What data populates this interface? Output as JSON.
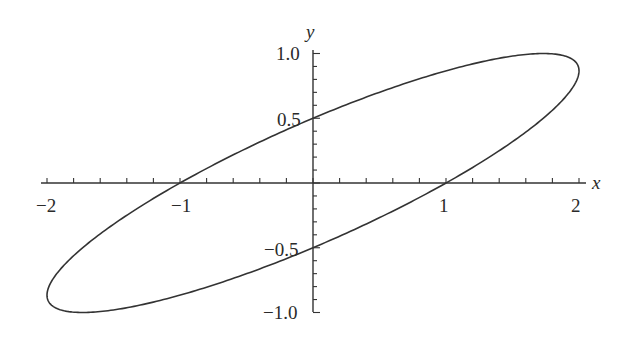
{
  "chart_data": {
    "type": "line",
    "title": "",
    "xlabel": "x",
    "ylabel": "y",
    "xlim": [
      -2.1,
      2.05
    ],
    "ylim": [
      -1.0,
      1.0
    ],
    "grid": false,
    "legend": null,
    "x_ticks": [
      -2,
      -1,
      1,
      2
    ],
    "x_tick_labels": [
      "−2",
      "−1",
      "1",
      "2"
    ],
    "y_ticks": [
      1.0,
      0.5,
      -0.5,
      -1.0
    ],
    "y_tick_labels": [
      "1.0",
      "0.5",
      "−0.5",
      "−1.0"
    ],
    "x_minor_step": 0.2,
    "y_minor_step": 0.1,
    "curve": {
      "description": "Closed tilted ellipse (parametric x = 2cos t, y = sin(t + π/3))",
      "x_amplitude": 2,
      "y_amplitude": 1,
      "phase": 1.0472,
      "key_points": [
        {
          "x": 1,
          "y": 0
        },
        {
          "x": -1,
          "y": 0
        },
        {
          "x": 0,
          "y": 0.5
        },
        {
          "x": 0,
          "y": -0.5
        },
        {
          "x": 2,
          "y": 0.866
        },
        {
          "x": -2,
          "y": -0.866
        },
        {
          "x": 1,
          "y": 1.0
        },
        {
          "x": -1,
          "y": -1.0
        }
      ]
    },
    "line_color": "#333333",
    "axis_color": "#333333"
  },
  "labels": {
    "x_axis": "x",
    "y_axis": "y",
    "x_ticks": [
      "−2",
      "−1",
      "1",
      "2"
    ],
    "y_ticks": [
      "1.0",
      "0.5",
      "−0.5",
      "−1.0"
    ]
  }
}
